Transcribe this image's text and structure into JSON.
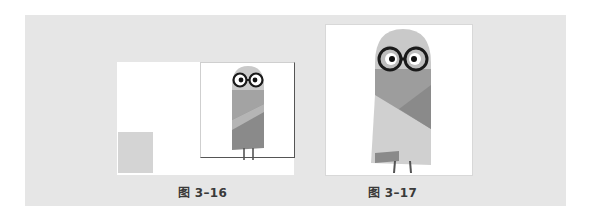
{
  "figures": [
    {
      "id": "left",
      "caption": "图 3–16",
      "description": "small owl character offset inside a larger canvas with a gray placeholder square at bottom-left"
    },
    {
      "id": "right",
      "caption": "图 3–17",
      "description": "owl character scaled up to fill its canvas"
    }
  ],
  "colors": {
    "card_background": "#e6e6e6",
    "panel_background": "#ffffff",
    "head": "#c9c9c9",
    "body_upper": "#9d9d9d",
    "robe_light": "#d0d0d0",
    "robe_dark": "#8a8a8a",
    "glasses": "#1a1a1a",
    "placeholder_square": "#d4d4d4"
  }
}
